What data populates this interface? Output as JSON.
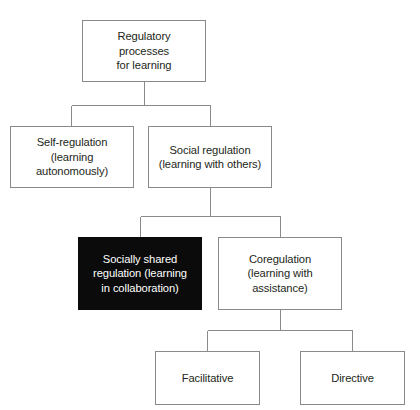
{
  "diagram": {
    "type": "hierarchy-tree",
    "title": "Regulatory processes for learning",
    "orientation": "top-down",
    "colors": {
      "line": "#8a8a8a",
      "box_border": "#8a8a8a",
      "box_fill": "#ffffff",
      "text": "#231f20",
      "highlight_fill": "#0b0b0b",
      "highlight_text": "#ffffff"
    },
    "nodes": {
      "root": {
        "label": "Regulatory\nprocesses\nfor learning",
        "level": 1,
        "highlighted": false
      },
      "self_regulation": {
        "label": "Self-regulation\n(learning\nautonomously)",
        "level": 2,
        "highlighted": false
      },
      "social_regulation": {
        "label": "Social regulation\n(learning with others)",
        "level": 2,
        "highlighted": false
      },
      "socially_shared_regulation": {
        "label": "Socially shared\nregulation (learning\nin collaboration)",
        "level": 3,
        "highlighted": true
      },
      "coregulation": {
        "label": "Coregulation\n(learning with\nassistance)",
        "level": 3,
        "highlighted": false
      },
      "facilitative": {
        "label": "Facilitative",
        "level": 4,
        "highlighted": false
      },
      "directive": {
        "label": "Directive",
        "level": 4,
        "highlighted": false
      }
    },
    "edges": [
      {
        "from": "root",
        "to": "self_regulation"
      },
      {
        "from": "root",
        "to": "social_regulation"
      },
      {
        "from": "social_regulation",
        "to": "socially_shared_regulation"
      },
      {
        "from": "social_regulation",
        "to": "coregulation"
      },
      {
        "from": "coregulation",
        "to": "facilitative"
      },
      {
        "from": "coregulation",
        "to": "directive"
      }
    ]
  }
}
